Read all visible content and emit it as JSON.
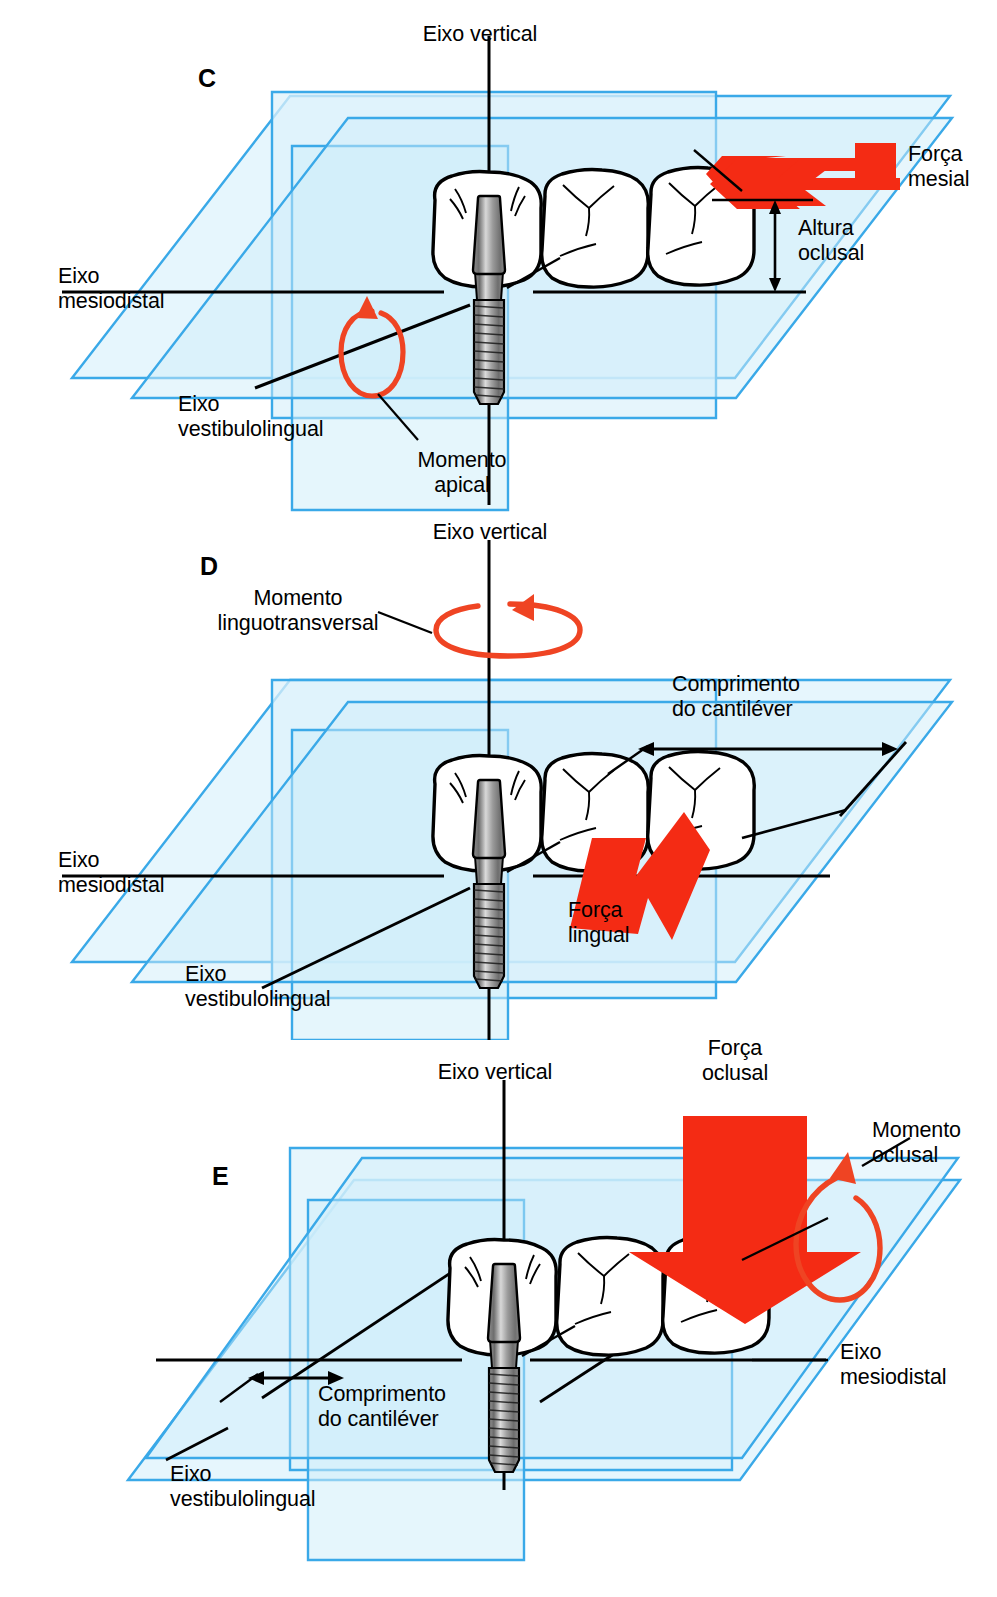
{
  "figure": {
    "colors": {
      "plane_stroke": "#3aa9e8",
      "plane_fill_light": "#f2fbfe",
      "plane_fill_mid": "#d8f1fb",
      "plane_fill_dark": "#c2e9f8",
      "force_arrow": "#f42b14",
      "moment_arrow": "#ef4423",
      "axis_line": "#000000",
      "tooth_outline": "#000000",
      "implant_metal": "#8a8a8a"
    }
  },
  "panels": [
    {
      "id": "C",
      "letter": "C",
      "labels": {
        "vertical_axis": "Eixo vertical",
        "mesiodistal_axis": "Eixo\nmesiodistal",
        "buccolingual_axis": "Eixo\nvestibulolingual",
        "apical_moment": "Momento\napical",
        "mesial_force": "Força\nmesial",
        "occlusal_height": "Altura\noclusal"
      },
      "elements": {
        "force_arrow_direction": "left",
        "force_arrow_name": "mesial-force-arrow",
        "moment_arrow_name": "apical-moment-arrow",
        "dimension_name": "occlusal-height-dimension",
        "teeth_count": 3,
        "implant_position": "first"
      }
    },
    {
      "id": "D",
      "letter": "D",
      "labels": {
        "vertical_axis": "Eixo vertical",
        "mesiodistal_axis": "Eixo\nmesiodistal",
        "buccolingual_axis": "Eixo\nvestibulolingual",
        "linguotransverse_moment": "Momento\nlinguotransversal",
        "lingual_force": "Força\nlingual",
        "cantilever_length": "Comprimento\ndo cantiléver"
      },
      "elements": {
        "force_arrow_direction": "right",
        "force_arrow_name": "lingual-force-arrow",
        "moment_arrow_name": "linguotransverse-moment-arrow",
        "dimension_name": "cantilever-length-dimension",
        "teeth_count": 3,
        "implant_position": "first"
      }
    },
    {
      "id": "E",
      "letter": "E",
      "labels": {
        "vertical_axis": "Eixo vertical",
        "mesiodistal_axis": "Eixo\nmesiodistal",
        "buccolingual_axis": "Eixo\nvestibulolingual",
        "occlusal_moment": "Momento\noclusal",
        "occlusal_force": "Força\noclusal",
        "cantilever_length": "Comprimento\ndo cantiléver"
      },
      "elements": {
        "force_arrow_direction": "down",
        "force_arrow_name": "occlusal-force-arrow",
        "moment_arrow_name": "occlusal-moment-arrow",
        "dimension_name": "cantilever-length-dimension",
        "teeth_count": 3,
        "implant_position": "first"
      }
    }
  ]
}
